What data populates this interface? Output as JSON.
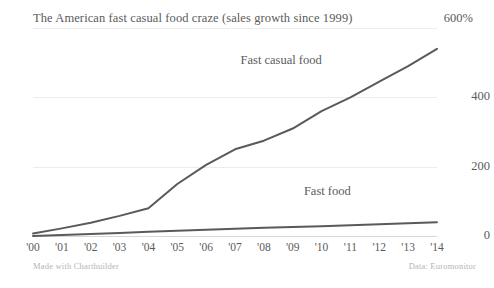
{
  "chart_data": {
    "type": "line",
    "title": "The American fast casual food craze (sales growth since 1999)",
    "unit_label": "600%",
    "xlabel": "",
    "ylabel": "",
    "grid": true,
    "legend_position": "inline-labels",
    "x": [
      "'00",
      "'01",
      "'02",
      "'03",
      "'04",
      "'05",
      "'06",
      "'07",
      "'08",
      "'09",
      "'10",
      "'11",
      "'12",
      "'13",
      "'14"
    ],
    "xlim": [
      0,
      14
    ],
    "ylim": [
      0,
      600
    ],
    "yticks": [
      0,
      200,
      400,
      600
    ],
    "ytick_labels": [
      "0",
      "200",
      "400",
      "600%"
    ],
    "series": [
      {
        "name": "Fast casual food",
        "color": "#5a5a5a",
        "values": [
          7,
          22,
          38,
          58,
          80,
          150,
          205,
          250,
          275,
          310,
          360,
          400,
          445,
          490,
          540
        ]
      },
      {
        "name": "Fast food",
        "color": "#5a5a5a",
        "values": [
          0,
          3,
          6,
          9,
          12,
          15,
          18,
          21,
          24,
          26,
          28,
          31,
          34,
          37,
          40
        ]
      }
    ],
    "annotations": [
      {
        "text": "Fast casual food",
        "x": 8.6,
        "y": 505
      },
      {
        "text": "Fast food",
        "x": 10.2,
        "y": 128
      }
    ]
  },
  "footer": {
    "left": "Made with Chartbuilder",
    "right": "Data: Euromonitor"
  }
}
